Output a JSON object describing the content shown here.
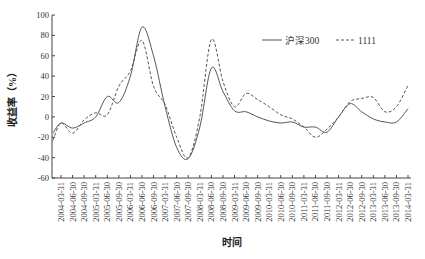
{
  "chart_data": {
    "type": "line",
    "title": "",
    "xlabel": "时间",
    "ylabel": "收益率（%）",
    "ylim": [
      -60,
      100
    ],
    "yticks": [
      100,
      80,
      60,
      40,
      20,
      0,
      -20,
      -40,
      -60
    ],
    "grid": false,
    "legend_position": "top-right",
    "categories": [
      "2004-03-31",
      "2004-06-30",
      "2004-09-30",
      "2005-03-31",
      "2005-06-30",
      "2005-09-30",
      "2006-03-31",
      "2006-06-30",
      "2006-09-30",
      "2007-03-31",
      "2007-06-30",
      "2007-09-30",
      "2008-03-31",
      "2008-06-30",
      "2008-09-30",
      "2009-03-31",
      "2009-06-30",
      "2009-09-30",
      "2010-03-31",
      "2010-06-30",
      "2010-09-30",
      "2011-03-31",
      "2011-06-30",
      "2011-09-30",
      "2012-03-31",
      "2012-06-30",
      "2012-09-30",
      "2013-03-31",
      "2013-06-30",
      "2013-09-30",
      "2014-03-31"
    ],
    "series": [
      {
        "name": "沪深300",
        "style": "solid",
        "color": "#555555",
        "start_value": -16,
        "values": [
          -6,
          -11,
          -6,
          0,
          20,
          14,
          40,
          88,
          60,
          10,
          -30,
          -41,
          -10,
          48,
          25,
          6,
          5,
          0,
          -4,
          -6,
          -5,
          -10,
          -10,
          -15,
          0,
          13,
          5,
          -2,
          -5,
          -5,
          8
        ]
      },
      {
        "name": "1111",
        "style": "dashed",
        "color": "#555555",
        "start_value": -23,
        "values": [
          -6,
          -16,
          -3,
          4,
          2,
          30,
          45,
          75,
          30,
          12,
          -20,
          -40,
          0,
          76,
          35,
          10,
          23,
          17,
          10,
          2,
          -2,
          -10,
          -20,
          -12,
          0,
          15,
          18,
          19,
          5,
          10,
          31
        ]
      }
    ]
  },
  "axes": {
    "ylabel": "收益率（%）",
    "xlabel": "时间"
  },
  "legend": {
    "items": [
      {
        "label": "沪深300",
        "style": "solid"
      },
      {
        "label": "1111",
        "style": "dashed"
      }
    ]
  }
}
